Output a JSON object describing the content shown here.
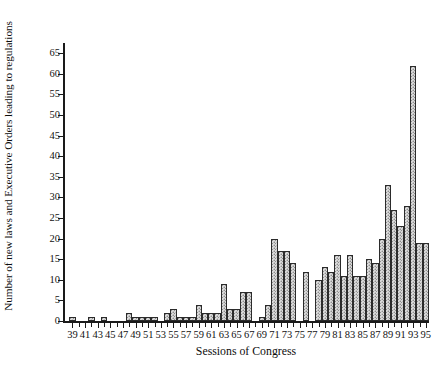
{
  "chart_data": {
    "type": "bar",
    "title": "",
    "xlabel": "Sessions of Congress",
    "ylabel": "Number of new laws and Executive Orders leading to regulations",
    "xlim": [
      38,
      96
    ],
    "ylim": [
      0,
      67
    ],
    "ytick_labels": [
      "0",
      "5",
      "10",
      "15",
      "20",
      "25",
      "30",
      "35",
      "40",
      "45",
      "50",
      "55",
      "60",
      "65"
    ],
    "ytick_values": [
      0,
      5,
      10,
      15,
      20,
      25,
      30,
      35,
      40,
      45,
      50,
      55,
      60,
      65
    ],
    "xtick_labels": [
      "39",
      "41",
      "43",
      "45",
      "47",
      "49",
      "51",
      "53",
      "55",
      "57",
      "59",
      "61",
      "63",
      "65",
      "67",
      "69",
      "71",
      "73",
      "75",
      "77",
      "79",
      "81",
      "83",
      "85",
      "87",
      "89",
      "91",
      "93",
      "95"
    ],
    "xtick_values": [
      39,
      41,
      43,
      45,
      47,
      49,
      51,
      53,
      55,
      57,
      59,
      61,
      63,
      65,
      67,
      69,
      71,
      73,
      75,
      77,
      79,
      81,
      83,
      85,
      87,
      89,
      91,
      93,
      95
    ],
    "grid": false,
    "legend": null,
    "bar_fill_color": "#d8d8d8",
    "bar_edge_color": "#2b2b2b",
    "categories": [
      39,
      40,
      41,
      42,
      43,
      44,
      45,
      46,
      47,
      48,
      49,
      50,
      51,
      52,
      53,
      54,
      55,
      56,
      57,
      58,
      59,
      60,
      61,
      62,
      63,
      64,
      65,
      66,
      67,
      68,
      69,
      70,
      71,
      72,
      73,
      74,
      75,
      76,
      77,
      78,
      79,
      80,
      81,
      82,
      83,
      84,
      85,
      86,
      87,
      88,
      89,
      90,
      91,
      92,
      93,
      94,
      95
    ],
    "values": [
      1,
      0,
      0,
      1,
      0,
      1,
      0,
      0,
      0,
      2,
      1,
      1,
      1,
      1,
      0,
      2,
      3,
      1,
      1,
      1,
      4,
      2,
      2,
      2,
      9,
      3,
      3,
      7,
      7,
      0,
      1,
      4,
      20,
      17,
      17,
      14,
      0,
      12,
      0,
      10,
      13,
      12,
      16,
      11,
      16,
      11,
      11,
      15,
      14,
      20,
      33,
      27,
      23,
      28,
      62,
      19,
      19
    ]
  }
}
